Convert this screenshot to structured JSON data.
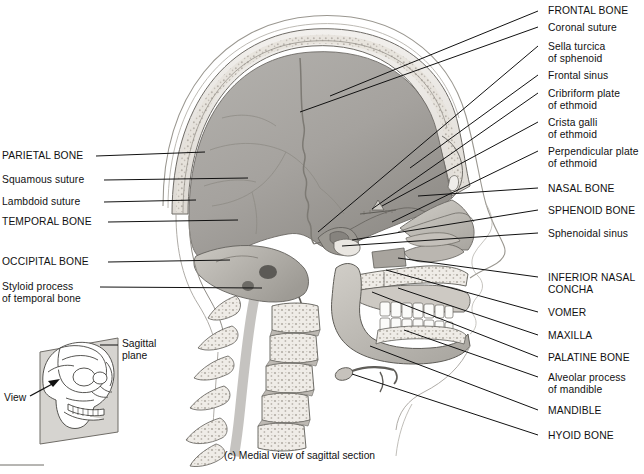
{
  "figure": {
    "caption": "(c) Medial view of sagittal section",
    "colors": {
      "ink": "#111111",
      "bone_light": "#e8e6e2",
      "bone_mid": "#b9b5ae",
      "cavity_gray": "#a9a7a4",
      "cavity_dark": "#8e8b87",
      "plane_gray": "#d6d4d0",
      "tooth_white": "#fbfbf9"
    }
  },
  "labels_right": [
    {
      "text": "FRONTAL BONE",
      "lines": [
        "FRONTAL BONE"
      ],
      "x": 548,
      "y": 5,
      "tip": [
        538,
        11
      ],
      "anchor": [
        330,
        96
      ]
    },
    {
      "text": "Coronal suture",
      "lines": [
        "Coronal suture"
      ],
      "x": 548,
      "y": 22,
      "tip": [
        538,
        27
      ],
      "anchor": [
        300,
        112
      ]
    },
    {
      "text": "Sella turcica of sphenoid",
      "lines": [
        "Sella turcica",
        "of sphenoid"
      ],
      "x": 548,
      "y": 41,
      "tip": [
        538,
        46
      ],
      "anchor": [
        318,
        232
      ]
    },
    {
      "text": "Frontal sinus",
      "lines": [
        "Frontal sinus"
      ],
      "x": 548,
      "y": 70,
      "tip": [
        538,
        75
      ],
      "anchor": [
        410,
        168
      ]
    },
    {
      "text": "Cribriform plate of ethmoid",
      "lines": [
        "Cribriform plate",
        "of ethmoid"
      ],
      "x": 548,
      "y": 88,
      "tip": [
        538,
        93
      ],
      "anchor": [
        372,
        209
      ]
    },
    {
      "text": "Crista galli of ethmoid",
      "lines": [
        "Crista galli",
        "of ethmoid"
      ],
      "x": 548,
      "y": 117,
      "tip": [
        538,
        122
      ],
      "anchor": [
        382,
        206
      ]
    },
    {
      "text": "Perpendicular plate of ethmoid",
      "lines": [
        "Perpendicular plate",
        "of ethmoid"
      ],
      "x": 548,
      "y": 146,
      "tip": [
        538,
        151
      ],
      "anchor": [
        392,
        222
      ]
    },
    {
      "text": "NASAL BONE",
      "lines": [
        "NASAL BONE"
      ],
      "x": 548,
      "y": 183,
      "tip": [
        538,
        188
      ],
      "anchor": [
        418,
        196
      ]
    },
    {
      "text": "SPHENOID BONE",
      "lines": [
        "SPHENOID BONE"
      ],
      "x": 548,
      "y": 205,
      "tip": [
        538,
        210
      ],
      "anchor": [
        352,
        240
      ]
    },
    {
      "text": "Sphenoidal sinus",
      "lines": [
        "Sphenoidal sinus"
      ],
      "x": 548,
      "y": 228,
      "tip": [
        538,
        233
      ],
      "anchor": [
        342,
        246
      ]
    },
    {
      "text": "INFERIOR NASAL CONCHA",
      "lines": [
        "INFERIOR NASAL",
        "CONCHA"
      ],
      "x": 548,
      "y": 272,
      "tip": [
        538,
        277
      ],
      "anchor": [
        398,
        258
      ]
    },
    {
      "text": "VOMER",
      "lines": [
        "VOMER"
      ],
      "x": 548,
      "y": 307,
      "tip": [
        538,
        312
      ],
      "anchor": [
        386,
        270
      ]
    },
    {
      "text": "MAXILLA",
      "lines": [
        "MAXILLA"
      ],
      "x": 548,
      "y": 330,
      "tip": [
        538,
        335
      ],
      "anchor": [
        398,
        288
      ]
    },
    {
      "text": "PALATINE BONE",
      "lines": [
        "PALATINE BONE"
      ],
      "x": 548,
      "y": 352,
      "tip": [
        538,
        357
      ],
      "anchor": [
        372,
        292
      ]
    },
    {
      "text": "Alveolar process of mandible",
      "lines": [
        "Alveolar process",
        "of mandible"
      ],
      "x": 548,
      "y": 372,
      "tip": [
        538,
        377
      ],
      "anchor": [
        404,
        330
      ]
    },
    {
      "text": "MANDIBLE",
      "lines": [
        "MANDIBLE"
      ],
      "x": 548,
      "y": 405,
      "tip": [
        538,
        410
      ],
      "anchor": [
        370,
        346
      ]
    },
    {
      "text": "HYOID BONE",
      "lines": [
        "HYOID BONE"
      ],
      "x": 548,
      "y": 430,
      "tip": [
        538,
        435
      ],
      "anchor": [
        352,
        374
      ]
    }
  ],
  "labels_left": [
    {
      "text": "PARIETAL BONE",
      "lines": [
        "PARIETAL BONE"
      ],
      "x": 2,
      "y": 150,
      "tip": [
        96,
        156
      ],
      "anchor": [
        205,
        152
      ]
    },
    {
      "text": "Squamous suture",
      "lines": [
        "Squamous suture"
      ],
      "x": 2,
      "y": 174,
      "tip": [
        104,
        180
      ],
      "anchor": [
        248,
        178
      ]
    },
    {
      "text": "Lambdoid suture",
      "lines": [
        "Lambdoid suture"
      ],
      "x": 2,
      "y": 196,
      "tip": [
        104,
        202
      ],
      "anchor": [
        196,
        200
      ]
    },
    {
      "text": "TEMPORAL BONE",
      "lines": [
        "TEMPORAL BONE"
      ],
      "x": 2,
      "y": 216,
      "tip": [
        108,
        222
      ],
      "anchor": [
        238,
        220
      ]
    },
    {
      "text": "OCCIPITAL BONE",
      "lines": [
        "OCCIPITAL BONE"
      ],
      "x": 2,
      "y": 256,
      "tip": [
        108,
        262
      ],
      "anchor": [
        230,
        260
      ]
    },
    {
      "text": "Styloid process of temporal bone",
      "lines": [
        "Styloid process",
        "of temporal bone"
      ],
      "x": 2,
      "y": 281,
      "tip": [
        100,
        287
      ],
      "anchor": [
        262,
        288
      ]
    }
  ],
  "inset": {
    "plane_label": {
      "lines": [
        "Sagittal",
        "plane"
      ],
      "x": 122,
      "y": 338
    },
    "plane_leader": {
      "from": [
        118,
        345
      ],
      "to": [
        100,
        345
      ]
    },
    "view_label": {
      "lines": [
        "View"
      ],
      "x": 4,
      "y": 392
    },
    "view_arrow": {
      "from": [
        30,
        396
      ],
      "to": [
        58,
        381
      ]
    }
  }
}
